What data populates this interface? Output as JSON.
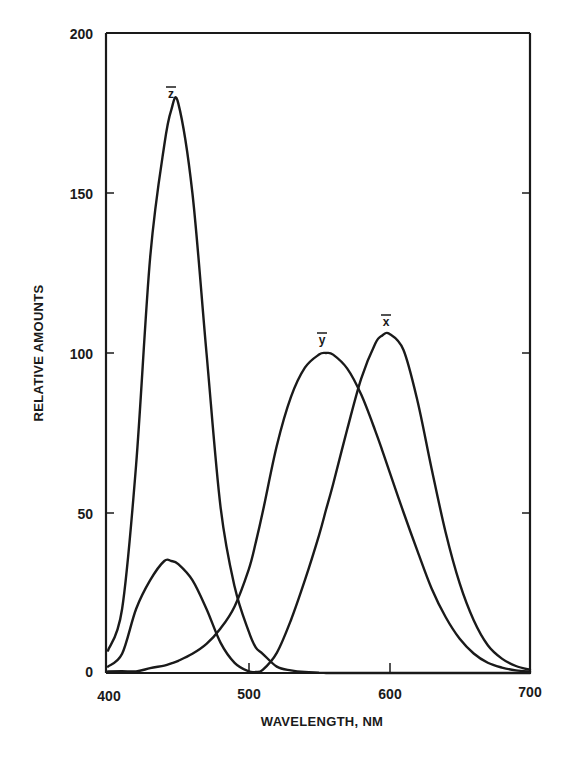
{
  "chart_data": {
    "type": "line",
    "title": "",
    "xlabel": "WAVELENGTH, NM",
    "ylabel": "RELATIVE AMOUNTS",
    "xlim": [
      400,
      700
    ],
    "ylim": [
      0,
      200
    ],
    "xticks": [
      400,
      500,
      600,
      700
    ],
    "yticks": [
      0,
      50,
      100,
      150,
      200
    ],
    "grid": false,
    "legend": "inline labels above curve peaks",
    "x": [
      400,
      410,
      420,
      430,
      440,
      445,
      450,
      460,
      470,
      480,
      490,
      500,
      505,
      510,
      520,
      530,
      540,
      550,
      555,
      560,
      570,
      580,
      590,
      595,
      600,
      610,
      620,
      630,
      640,
      650,
      660,
      670,
      680,
      690,
      700
    ],
    "series": [
      {
        "name": "x̄",
        "label": "x",
        "values": [
          2,
          6,
          20,
          29,
          35,
          35,
          34,
          29,
          20,
          9.5,
          3.2,
          0.5,
          0.3,
          1,
          6.3,
          16.5,
          29,
          43,
          51,
          59,
          76,
          92,
          103,
          105.5,
          106,
          101,
          85,
          64,
          44,
          28,
          16.5,
          8.7,
          4.5,
          2.2,
          1
        ]
      },
      {
        "name": "ȳ",
        "label": "y",
        "values": [
          0.5,
          0.6,
          0.5,
          1.5,
          2.3,
          3,
          3.8,
          6,
          9.1,
          13.9,
          20.8,
          32.3,
          40.7,
          50.3,
          71,
          86.2,
          95.4,
          99.5,
          100,
          99.5,
          95.2,
          87,
          75.7,
          69.5,
          63.1,
          50.3,
          38.1,
          26.5,
          17.5,
          10.7,
          6.1,
          3.2,
          1.7,
          0.8,
          0.4
        ]
      },
      {
        "name": "z̄",
        "label": "z",
        "values": [
          7,
          20,
          65,
          130,
          165,
          176,
          178,
          150,
          100,
          52,
          27,
          13,
          8,
          6,
          2,
          0.8,
          0.3,
          0.1,
          0,
          0,
          0,
          0,
          0,
          0,
          0,
          0,
          0,
          0,
          0,
          0,
          0,
          0,
          0,
          0,
          0
        ]
      }
    ]
  },
  "labels": {
    "x_bar": "x",
    "y_bar": "y",
    "z_bar": "z",
    "xlabel": "WAVELENGTH, NM",
    "ylabel": "RELATIVE AMOUNTS",
    "xtick_400": "400",
    "xtick_500": "500",
    "xtick_600": "600",
    "xtick_700": "700",
    "ytick_0": "0",
    "ytick_50": "50",
    "ytick_100": "100",
    "ytick_150": "150",
    "ytick_200": "200"
  },
  "colors": {
    "ink": "#1a1a1a",
    "background": "#ffffff"
  }
}
